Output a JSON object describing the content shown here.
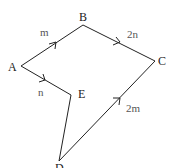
{
  "diagram": {
    "type": "vector-polygon",
    "vertices": [
      {
        "id": "A",
        "label": "A",
        "x": 21,
        "y": 66,
        "lx": 8,
        "ly": 71
      },
      {
        "id": "B",
        "label": "B",
        "x": 83,
        "y": 25,
        "lx": 79,
        "ly": 21
      },
      {
        "id": "C",
        "label": "C",
        "x": 155,
        "y": 61,
        "lx": 158,
        "ly": 65
      },
      {
        "id": "D",
        "label": "D",
        "x": 59,
        "y": 161,
        "lx": 55,
        "ly": 172
      },
      {
        "id": "E",
        "label": "E",
        "x": 71,
        "y": 95,
        "lx": 78,
        "ly": 98
      }
    ],
    "edges": [
      {
        "from": "A",
        "to": "B",
        "label": "m",
        "lx": 40,
        "ly": 36,
        "arrow": true
      },
      {
        "from": "B",
        "to": "C",
        "label": "2n",
        "lx": 127,
        "ly": 38,
        "arrow": true
      },
      {
        "from": "A",
        "to": "E",
        "label": "n",
        "lx": 38,
        "ly": 96,
        "arrow": true
      },
      {
        "from": "D",
        "to": "C",
        "label": "2m",
        "lx": 126,
        "ly": 112,
        "arrow": true
      },
      {
        "from": "E",
        "to": "D",
        "label": "",
        "arrow": false
      }
    ]
  }
}
